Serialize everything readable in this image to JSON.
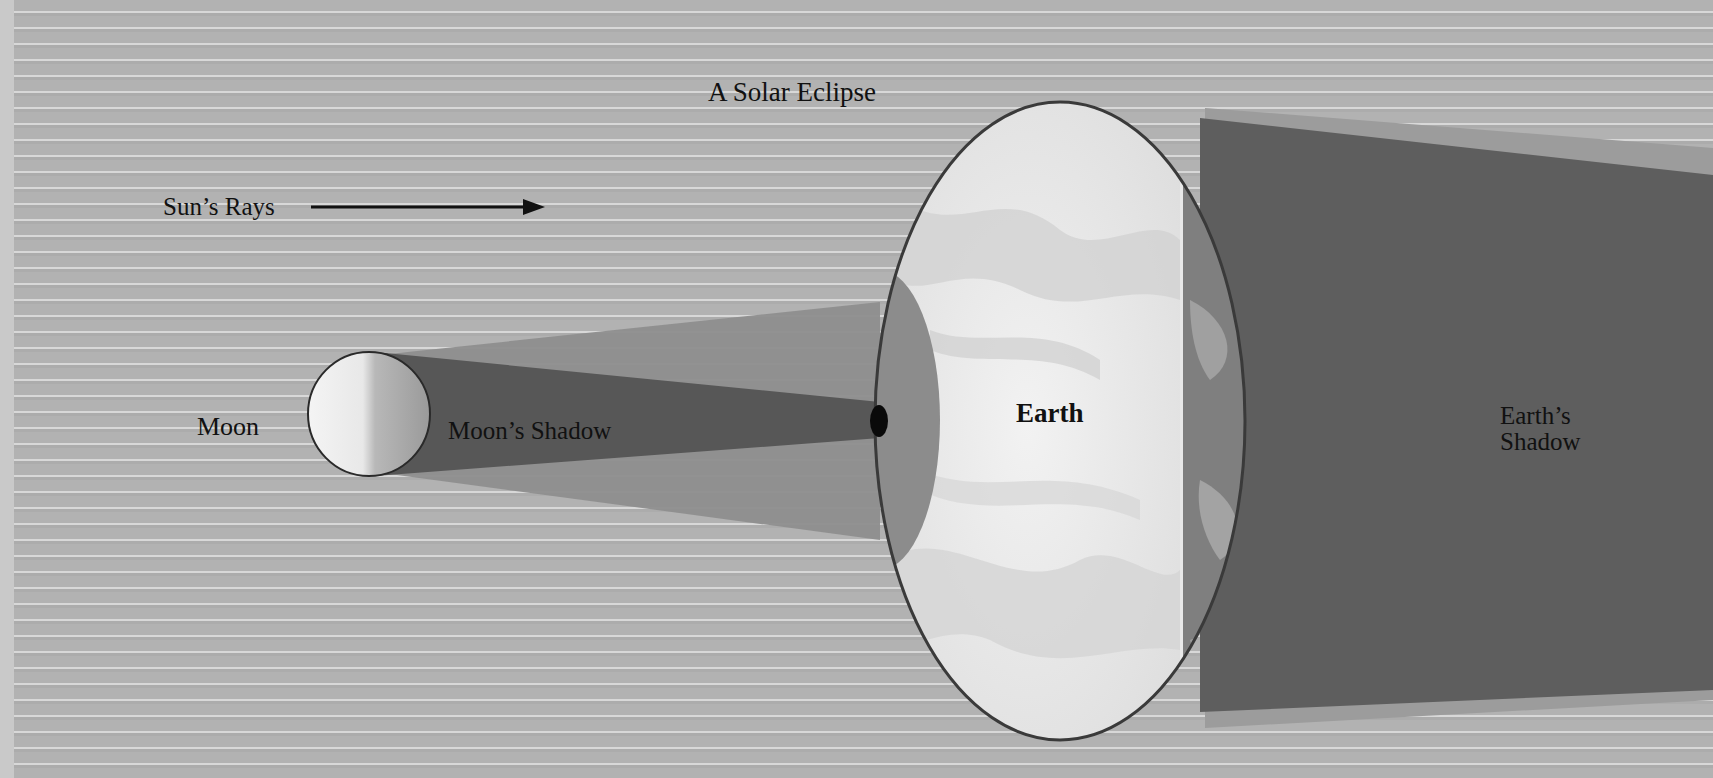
{
  "diagram": {
    "title": "A Solar Eclipse",
    "labels": {
      "sun_rays": "Sun’s Rays",
      "moon": "Moon",
      "moon_shadow": "Moon’s Shadow",
      "earth": "Earth",
      "earth_shadow_line1": "Earth’s",
      "earth_shadow_line2": "Shadow"
    },
    "arrow": {
      "direction": "right",
      "meaning": "direction of sunlight"
    },
    "colors": {
      "background": "#b2b2b2",
      "background_stripe": "#d8d8d8",
      "penumbra": "#8f8f8f",
      "umbra": "#565656",
      "moon_lit": "#f2f2f2",
      "moon_dark": "#9a9a9a",
      "earth_day": "#ececec",
      "earth_night": "#7e7e7e",
      "earth_shadow": "#5c5c5c",
      "earth_outline": "#3a3a3a",
      "text": "#111111"
    }
  }
}
